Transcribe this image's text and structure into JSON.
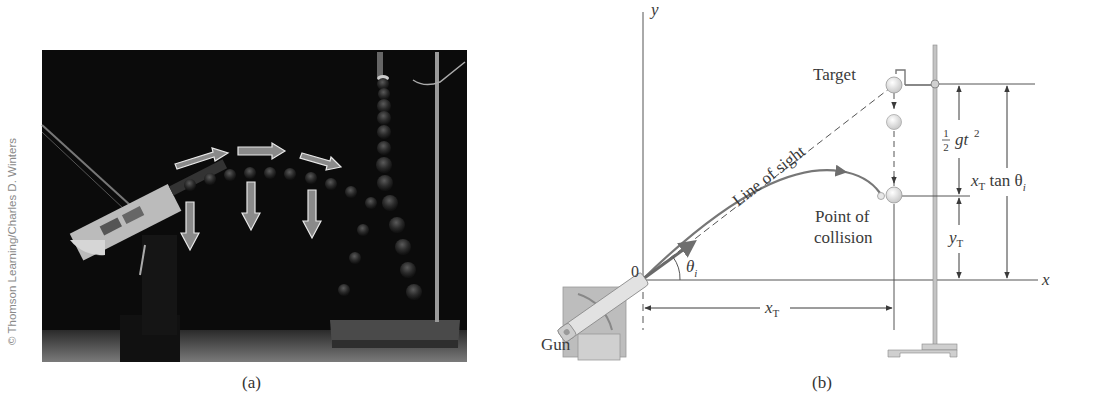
{
  "panel_a": {
    "caption": "(a)",
    "credit": "© Thomson Learning/Charles D. Winters",
    "description": "Stroboscopic photo of a projectile fired at a falling target; horizontal velocity arrows and vertical downward arrows overlaid"
  },
  "panel_b": {
    "caption": "(b)",
    "axis_y_label": "y",
    "axis_x_label": "x",
    "origin_label": "0",
    "angle_label": "θ",
    "angle_sub": "i",
    "gun_label": "Gun",
    "target_label": "Target",
    "line_of_sight_label": "Line of sight",
    "collision_label_line1": "Point of",
    "collision_label_line2": "collision",
    "half_num": "1",
    "half_den": "2",
    "fall_label": "gt",
    "fall_exp": "2",
    "xt_main": "x",
    "xt_sub": "T",
    "yt_main": "y",
    "yt_sub": "T",
    "xt_tan_main": "x",
    "xt_tan_sub": "T",
    "xt_tan_rest": " tan θ",
    "xt_tan_theta_sub": "i"
  },
  "colors": {
    "photo_bg": "#0c0c0c",
    "line": "#4a4a4a",
    "trajectory": "#6e6e6e",
    "ball": "#e6e6e6",
    "gun_box": "#bdbdbd"
  }
}
